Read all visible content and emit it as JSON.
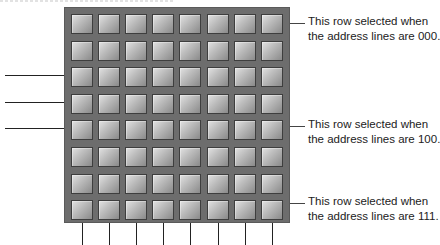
{
  "diagram": {
    "grid": {
      "rows": 8,
      "columns": 8
    },
    "address_lines_count": 3,
    "column_lines_count": 8,
    "annotations": [
      {
        "row": 0,
        "line1": "This row selected when",
        "line2": "the address lines are 000."
      },
      {
        "row": 4,
        "line1": "This row selected when",
        "line2": "the address lines are 100."
      },
      {
        "row": 7,
        "line1": "This row selected when",
        "line2": "the address lines are 111."
      }
    ],
    "colors": {
      "grid_background": "#6d6d6d",
      "cell_light": "#e2e2e2",
      "cell_dark": "#8a8a8a",
      "cell_border": "#3e3e3e",
      "line": "#222222",
      "text": "#222222"
    }
  }
}
